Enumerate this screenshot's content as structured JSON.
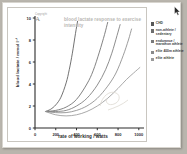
{
  "window": {
    "background_color": "#b9b5ad",
    "page_color": "#ffffff"
  },
  "watermark": {
    "text": "Copyright",
    "glyph": "A"
  },
  "cursor": {
    "icon": "mouse-pointer-icon"
  },
  "legend": {
    "position": "right",
    "items": [
      {
        "label": "CHD",
        "color": "#585858"
      },
      {
        "label": "non-athlete / sedentary",
        "color": "#6d6d6d"
      },
      {
        "label": "endurance / marathon athlete",
        "color": "#7a7a7a"
      },
      {
        "label": "elite 400m athlete",
        "color": "#8a8a8a"
      },
      {
        "label": "elite athlete",
        "color": "#9a9a9a"
      }
    ]
  },
  "chart_data": {
    "type": "line",
    "title": "blood lactate response to exercise intensity",
    "xlabel": "rate of working / watts",
    "ylabel": "blood lactate / mmol l⁻¹",
    "xlim": [
      0,
      1050
    ],
    "ylim": [
      0,
      10
    ],
    "xticks": [
      0,
      200,
      400,
      600,
      800,
      1000
    ],
    "xtick_labels": [
      "0",
      "200",
      "400",
      "600",
      "800",
      "1000"
    ],
    "yticks": [
      0,
      2,
      4,
      6,
      8,
      10
    ],
    "ytick_labels": [
      "0",
      "2",
      "4",
      "6",
      "8",
      "10"
    ],
    "grid": false,
    "legend_position": "right",
    "series": [
      {
        "name": "CHD",
        "color": "#585858",
        "x": [
          100,
          150,
          200,
          250,
          300,
          330,
          360,
          390,
          410
        ],
        "y": [
          1.5,
          1.7,
          2.1,
          2.8,
          4.1,
          5.3,
          6.8,
          8.6,
          9.7
        ]
      },
      {
        "name": "non-athlete / sedentary",
        "color": "#6d6d6d",
        "x": [
          100,
          200,
          300,
          400,
          500,
          560,
          620,
          670,
          700
        ],
        "y": [
          1.5,
          1.6,
          1.9,
          2.6,
          4.0,
          5.2,
          6.9,
          8.5,
          9.6
        ]
      },
      {
        "name": "endurance / marathon athlete",
        "color": "#7a7a7a",
        "x": [
          100,
          200,
          300,
          400,
          500,
          600,
          680,
          740,
          790,
          820
        ],
        "y": [
          1.5,
          1.5,
          1.6,
          2.0,
          2.7,
          3.9,
          5.3,
          6.8,
          8.4,
          9.4
        ]
      },
      {
        "name": "elite 400m athlete",
        "color": "#8a8a8a",
        "x": [
          100,
          200,
          300,
          400,
          500,
          600,
          700,
          780,
          850,
          900,
          930
        ],
        "y": [
          1.5,
          1.4,
          1.4,
          1.6,
          2.0,
          2.7,
          3.8,
          5.0,
          6.6,
          8.0,
          9.0
        ]
      },
      {
        "name": "elite athlete",
        "color": "#9a9a9a",
        "x": [
          100,
          200,
          300,
          400,
          500,
          600,
          700,
          800,
          880,
          950,
          1010
        ],
        "y": [
          1.5,
          1.2,
          1.1,
          1.2,
          1.5,
          2.0,
          2.7,
          3.6,
          4.4,
          5.0,
          5.5
        ]
      }
    ],
    "annotation": "annotation-scribble"
  }
}
